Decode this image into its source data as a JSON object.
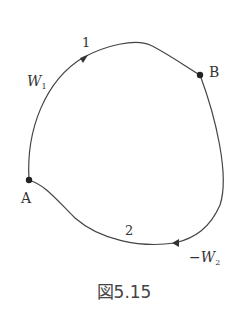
{
  "figure": {
    "caption": "図5.15",
    "points": [
      {
        "id": "A",
        "label": "A"
      },
      {
        "id": "B",
        "label": "B"
      }
    ],
    "paths": [
      {
        "id": "1",
        "label": "1",
        "work_label_main": "W",
        "work_label_sub": "1",
        "direction": "A-to-B"
      },
      {
        "id": "2",
        "label": "2",
        "work_label_prefix": "−",
        "work_label_main": "W",
        "work_label_sub": "2",
        "direction": "B-to-A"
      }
    ],
    "colors": {
      "stroke": "#444444",
      "dot": "#222222",
      "text": "#333333"
    }
  }
}
